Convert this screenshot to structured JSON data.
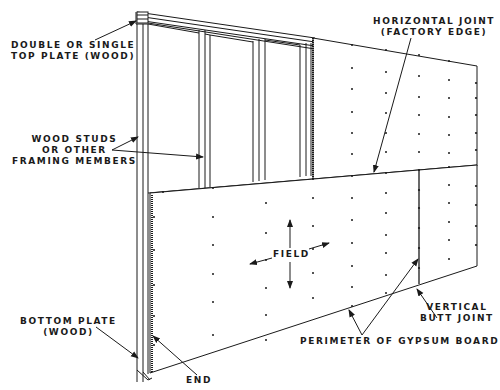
{
  "diagram": {
    "colors": {
      "ink": "#1a1a1a",
      "background": "#ffffff"
    },
    "labels": {
      "top_plate": {
        "line1": "DOUBLE OR SINGLE",
        "line2": "TOP PLATE (WOOD)"
      },
      "studs": {
        "line1": "WOOD STUDS",
        "line2": "OR OTHER",
        "line3": "FRAMING MEMBERS"
      },
      "horizontal_joint": {
        "line1": "HORIZONTAL JOINT",
        "line2": "(FACTORY EDGE)"
      },
      "field": {
        "text": "FIELD"
      },
      "bottom_plate": {
        "line1": "BOTTOM PLATE",
        "line2": "(WOOD)"
      },
      "end": {
        "text": "END"
      },
      "vertical_butt_joint": {
        "line1": "VERTICAL",
        "line2": "BUTT JOINT"
      },
      "perimeter": {
        "text": "PERIMETER OF GYPSUM BOARD"
      }
    }
  }
}
